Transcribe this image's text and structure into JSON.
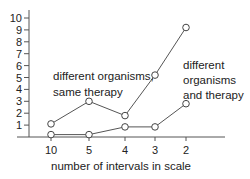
{
  "chart_data": {
    "type": "line",
    "title": "",
    "xlabel": "number of intervals in scale",
    "ylabel": "",
    "categories": [
      "10",
      "5",
      "4",
      "3",
      "2"
    ],
    "yticks": [
      "1",
      "2",
      "3",
      "4",
      "5",
      "6",
      "7",
      "8",
      "9",
      "10"
    ],
    "ylim": [
      0,
      10
    ],
    "grid": false,
    "legend": "none",
    "series": [
      {
        "name": "different organisms, same therapy",
        "values": [
          1.1,
          3.0,
          1.8,
          5.2,
          9.2
        ]
      },
      {
        "name": "different organisms and therapy",
        "values": [
          0.2,
          0.2,
          0.85,
          0.85,
          2.8
        ]
      }
    ],
    "annotations": [
      {
        "lines": [
          "different organisms,",
          "same therapy"
        ],
        "series": 0
      },
      {
        "lines": [
          "different",
          "organisms",
          "and therapy"
        ],
        "series": 1
      }
    ],
    "colors": {
      "line": "#555555",
      "marker_fill": "#ffffff",
      "text": "#222222"
    }
  }
}
